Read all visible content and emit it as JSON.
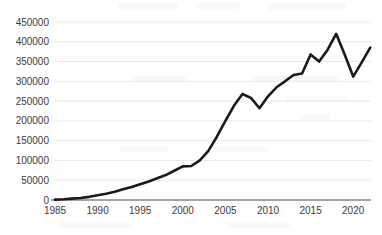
{
  "chart_data": {
    "type": "line",
    "title": "",
    "subtitle": "",
    "xlabel": "",
    "ylabel": "",
    "grid": "horizontal-only",
    "legend": "none",
    "xlim": [
      1985,
      2022
    ],
    "ylim": [
      0,
      450000
    ],
    "y_ticks": [
      0,
      50000,
      100000,
      150000,
      200000,
      250000,
      300000,
      350000,
      400000,
      450000
    ],
    "y_tick_labels": [
      "0",
      "50000",
      "100000",
      "150000",
      "200000",
      "250000",
      "300000",
      "350000",
      "400000",
      "450000"
    ],
    "x_ticks": [
      1985,
      1990,
      1995,
      2000,
      2005,
      2010,
      2015,
      2020
    ],
    "x_tick_labels": [
      "1985",
      "1990",
      "1995",
      "2000",
      "2005",
      "2010",
      "2015",
      "2020"
    ],
    "series": [
      {
        "name": "series-1",
        "color": "#1a1a1a",
        "x": [
          1985,
          1986,
          1987,
          1988,
          1989,
          1990,
          1991,
          1992,
          1993,
          1994,
          1995,
          1996,
          1997,
          1998,
          1999,
          2000,
          2001,
          2002,
          2003,
          2004,
          2005,
          2006,
          2007,
          2008,
          2009,
          2010,
          2011,
          2012,
          2013,
          2014,
          2015,
          2016,
          2017,
          2018,
          2019,
          2020,
          2021,
          2022
        ],
        "values": [
          1000,
          2000,
          3500,
          5000,
          8000,
          12000,
          16000,
          21000,
          27000,
          33000,
          40000,
          47000,
          55000,
          63000,
          74000,
          85000,
          86000,
          100000,
          124000,
          160000,
          200000,
          238000,
          268000,
          258000,
          232000,
          262000,
          285000,
          300000,
          316000,
          320000,
          368000,
          350000,
          380000,
          420000,
          368000,
          312000,
          348000,
          385000
        ]
      }
    ]
  },
  "axes": {
    "y_label_color": "#3b3b3b",
    "x_label_color": "#3b3b3b",
    "gridline_color": "#e3e3e3",
    "axis_color": "#4a4a4a"
  }
}
